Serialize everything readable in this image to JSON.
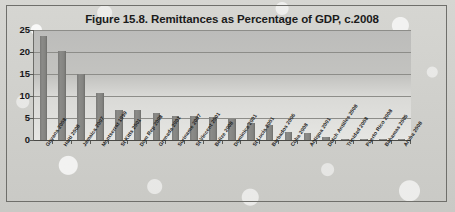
{
  "figure": {
    "title": "Figure 15.8. Remittances as Percentage of GDP, c.2008"
  },
  "chart_data": {
    "type": "bar",
    "title": "Figure 15.8. Remittances as Percentage of GDP, c.2008",
    "xlabel": "",
    "ylabel": "",
    "ylim": [
      0,
      25
    ],
    "yticks": [
      0,
      5,
      10,
      15,
      20,
      25
    ],
    "ytick_labels": [
      "0",
      "5",
      "10",
      "15",
      "20",
      "25"
    ],
    "grid": true,
    "legend": false,
    "bar_color": "#808080",
    "plot_background": "#c4c4c1",
    "categories": [
      "Guyana 2008",
      "Haiti 2008",
      "Jamaica 2007",
      "Montserrat 1999",
      "St Kitts 2001",
      "Dom Rep 2008",
      "Grenada 2001",
      "Suriname 2007",
      "St Vincent 2001",
      "Belize 2008",
      "Dominica 2001",
      "St Lucia 2001",
      "Barbados 2006",
      "Cuba 2008",
      "Antigua 2001",
      "Dutch Antilles 2008",
      "Trinidad 2008",
      "Puerto Rico 2008",
      "Bahamas 2005",
      "Aruba 2008"
    ],
    "values": [
      23.6,
      20.2,
      14.9,
      10.7,
      6.9,
      6.8,
      6.1,
      5.5,
      5.4,
      5.2,
      4.8,
      3.8,
      3.3,
      1.8,
      1.5,
      0.7,
      0.3,
      0.3,
      0.3,
      0.2
    ]
  }
}
